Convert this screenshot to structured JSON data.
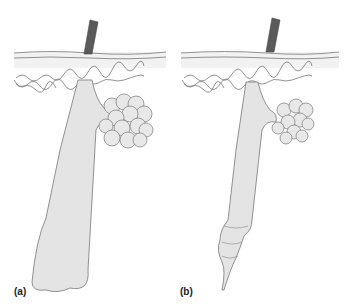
{
  "figure": {
    "panels": [
      {
        "id": "a",
        "label": "(a)",
        "description": "Hair follicle with bulb base and sebaceous gland"
      },
      {
        "id": "b",
        "label": "(b)",
        "description": "Hair follicle with tapered, segmented base and smaller sebaceous gland"
      }
    ]
  },
  "colors": {
    "hair": "#5a5a5a",
    "skin_fill": "#efefef",
    "follicle_fill": "#e4e4e4",
    "outline": "#777777"
  }
}
